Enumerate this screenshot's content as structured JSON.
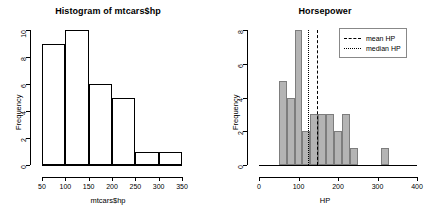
{
  "chart_data": [
    {
      "type": "bar",
      "id": "histogram-mtcars-hp",
      "title": "Histogram of mtcars$hp",
      "xlabel": "mtcars$hp",
      "ylabel": "Frequency",
      "xlim": [
        50,
        350
      ],
      "ylim": [
        0,
        10
      ],
      "xticks": [
        50,
        100,
        150,
        200,
        250,
        300,
        350
      ],
      "yticks": [
        0,
        2,
        4,
        6,
        8,
        10
      ],
      "grid": false,
      "legend": null,
      "bin_width": 50,
      "bin_edges": [
        50,
        100,
        150,
        200,
        250,
        300,
        350
      ],
      "categories": [
        "50-100",
        "100-150",
        "150-200",
        "200-250",
        "250-300",
        "300-350"
      ],
      "values": [
        9,
        10,
        6,
        5,
        1,
        1
      ],
      "bar_fill": "#ffffff",
      "bar_border": "#000000"
    },
    {
      "type": "bar",
      "id": "horsepower-histogram",
      "title": "Horsepower",
      "xlabel": "HP",
      "ylabel": "Frequency",
      "xlim": [
        0,
        400
      ],
      "ylim": [
        0,
        8
      ],
      "xticks": [
        0,
        100,
        200,
        300,
        400
      ],
      "yticks": [
        0,
        2,
        4,
        6,
        8
      ],
      "grid": false,
      "bin_width": 20,
      "bin_edges": [
        50,
        70,
        90,
        110,
        130,
        150,
        170,
        190,
        210,
        230,
        250,
        270,
        290,
        310,
        330,
        350
      ],
      "categories": [
        "50-70",
        "70-90",
        "90-110",
        "110-130",
        "130-150",
        "150-170",
        "170-190",
        "190-210",
        "210-230",
        "230-250",
        "250-270",
        "270-290",
        "290-310",
        "310-330",
        "330-350"
      ],
      "values": [
        5,
        4,
        8,
        2,
        3,
        3,
        3,
        2,
        3,
        1,
        0,
        0,
        0,
        1,
        0
      ],
      "bar_fill": "#b4b4b4",
      "bar_border": "#7d7d7d",
      "annotations": [
        {
          "name": "median HP",
          "value": 123,
          "style": "dotted",
          "color": "#000000"
        },
        {
          "name": "mean HP",
          "value": 147,
          "style": "dashed",
          "color": "#000000"
        }
      ],
      "legend_position": "top-right",
      "legend": [
        {
          "label": "mean HP",
          "style": "dashed"
        },
        {
          "label": "median HP",
          "style": "dotted"
        }
      ]
    }
  ]
}
